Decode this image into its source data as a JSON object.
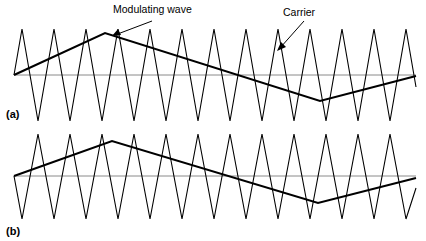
{
  "figure": {
    "title": "",
    "background_color": "#ffffff",
    "ink_color": "#000000",
    "axis_color": "#8a8a8a",
    "width": 426,
    "height": 241
  },
  "annotations": {
    "modulating_label": "Modulating wave",
    "carrier_label": "Carrier"
  },
  "panels": [
    {
      "id": "a",
      "label": "(a)"
    },
    {
      "id": "b",
      "label": "(b)"
    }
  ],
  "chart_data": {
    "type": "line",
    "title": "",
    "xlabel": "",
    "ylabel": "",
    "grid": false,
    "legend": "none",
    "panels": [
      {
        "id": "a",
        "label": "(a)",
        "axis": {
          "y_zero_px": 75,
          "x_start_px": 14,
          "x_end_px": 416
        },
        "series": [
          {
            "name": "Carrier",
            "type": "triangle-wave",
            "stroke_width": 1.1,
            "cycles": 12,
            "start_direction": "up",
            "amplitude_up_px": 46,
            "amplitude_down_px": 46,
            "points_px": [
              [
                14,
                75
              ],
              [
                22,
                29
              ],
              [
                38,
                121
              ],
              [
                54,
                29
              ],
              [
                70,
                121
              ],
              [
                86,
                29
              ],
              [
                102,
                121
              ],
              [
                118,
                29
              ],
              [
                134,
                121
              ],
              [
                150,
                29
              ],
              [
                166,
                121
              ],
              [
                182,
                29
              ],
              [
                198,
                121
              ],
              [
                214,
                29
              ],
              [
                230,
                121
              ],
              [
                246,
                29
              ],
              [
                262,
                121
              ],
              [
                278,
                29
              ],
              [
                294,
                121
              ],
              [
                310,
                29
              ],
              [
                326,
                121
              ],
              [
                342,
                29
              ],
              [
                358,
                121
              ],
              [
                374,
                29
              ],
              [
                390,
                121
              ],
              [
                406,
                29
              ],
              [
                416,
                87
              ]
            ]
          },
          {
            "name": "Modulating wave",
            "type": "triangle-wave",
            "stroke_width": 2.1,
            "cycles": 1,
            "start_direction": "up",
            "peak_px": [
              105,
              33
            ],
            "trough_px": [
              320,
              101
            ],
            "points_px": [
              [
                14,
                75
              ],
              [
                105,
                33
              ],
              [
                320,
                101
              ],
              [
                416,
                76
              ]
            ]
          }
        ]
      },
      {
        "id": "b",
        "label": "(b)",
        "axis": {
          "y_zero_px": 176,
          "x_start_px": 14,
          "x_end_px": 416
        },
        "series": [
          {
            "name": "Carrier",
            "type": "triangle-wave",
            "stroke_width": 1.1,
            "cycles": 12,
            "start_direction": "down",
            "amplitude_up_px": 40,
            "amplitude_down_px": 40,
            "points_px": [
              [
                14,
                176
              ],
              [
                22,
                219
              ],
              [
                38,
                134
              ],
              [
                54,
                219
              ],
              [
                70,
                134
              ],
              [
                86,
                219
              ],
              [
                102,
                134
              ],
              [
                118,
                219
              ],
              [
                134,
                134
              ],
              [
                150,
                219
              ],
              [
                166,
                134
              ],
              [
                182,
                219
              ],
              [
                198,
                134
              ],
              [
                214,
                219
              ],
              [
                230,
                134
              ],
              [
                246,
                219
              ],
              [
                262,
                134
              ],
              [
                278,
                219
              ],
              [
                294,
                134
              ],
              [
                310,
                219
              ],
              [
                326,
                134
              ],
              [
                342,
                219
              ],
              [
                358,
                134
              ],
              [
                374,
                219
              ],
              [
                390,
                134
              ],
              [
                406,
                219
              ],
              [
                416,
                188
              ]
            ]
          },
          {
            "name": "Modulating wave",
            "type": "triangle-wave",
            "stroke_width": 2.1,
            "cycles": 1,
            "start_direction": "up",
            "peak_px": [
              112,
              141
            ],
            "trough_px": [
              318,
              203
            ],
            "points_px": [
              [
                14,
                176
              ],
              [
                112,
                141
              ],
              [
                318,
                203
              ],
              [
                416,
                178
              ]
            ]
          }
        ]
      }
    ],
    "annotations": [
      {
        "text": "Modulating wave",
        "text_px": [
          113,
          4
        ],
        "leader_from_px": [
          152,
          21
        ],
        "leader_to_px": [
          112,
          36
        ]
      },
      {
        "text": "Carrier",
        "text_px": [
          283,
          7
        ],
        "leader_from_px": [
          304,
          21
        ],
        "leader_to_px": [
          277,
          50
        ]
      }
    ]
  }
}
